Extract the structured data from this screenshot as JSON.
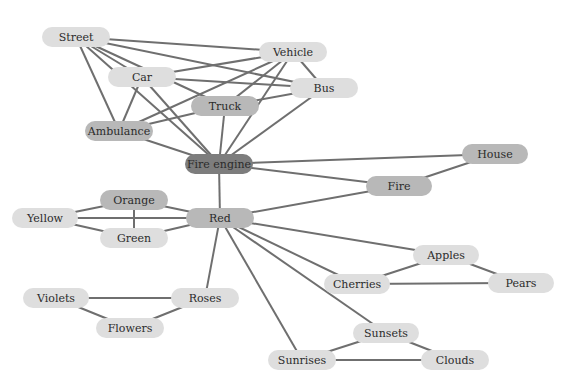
{
  "diagram": {
    "type": "concept-network",
    "colors": {
      "edge": "#6f6f6f",
      "light": "#dedede",
      "medium": "#b8b8b8",
      "dark": "#7d7d7d"
    },
    "nodes": [
      {
        "id": "street",
        "label": "Street",
        "x": 76,
        "y": 37,
        "w": 68,
        "shade": "light"
      },
      {
        "id": "vehicle",
        "label": "Vehicle",
        "x": 293,
        "y": 52,
        "w": 68,
        "shade": "light"
      },
      {
        "id": "car",
        "label": "Car",
        "x": 142,
        "y": 77,
        "w": 68,
        "shade": "light"
      },
      {
        "id": "bus",
        "label": "Bus",
        "x": 324,
        "y": 88,
        "w": 68,
        "shade": "light"
      },
      {
        "id": "truck",
        "label": "Truck",
        "x": 225,
        "y": 106,
        "w": 68,
        "shade": "medium"
      },
      {
        "id": "ambulance",
        "label": "Ambulance",
        "x": 119,
        "y": 131,
        "w": 68,
        "shade": "medium"
      },
      {
        "id": "fire_engine",
        "label": "Fire engine",
        "x": 219,
        "y": 164,
        "w": 68,
        "shade": "dark"
      },
      {
        "id": "house",
        "label": "House",
        "x": 495,
        "y": 154,
        "w": 66,
        "shade": "medium"
      },
      {
        "id": "fire",
        "label": "Fire",
        "x": 399,
        "y": 186,
        "w": 66,
        "shade": "medium"
      },
      {
        "id": "orange",
        "label": "Orange",
        "x": 134,
        "y": 200,
        "w": 68,
        "shade": "medium"
      },
      {
        "id": "yellow",
        "label": "Yellow",
        "x": 45,
        "y": 218,
        "w": 66,
        "shade": "light"
      },
      {
        "id": "red",
        "label": "Red",
        "x": 220,
        "y": 218,
        "w": 68,
        "shade": "medium"
      },
      {
        "id": "green",
        "label": "Green",
        "x": 134,
        "y": 238,
        "w": 68,
        "shade": "light"
      },
      {
        "id": "apples",
        "label": "Apples",
        "x": 446,
        "y": 255,
        "w": 66,
        "shade": "light"
      },
      {
        "id": "cherries",
        "label": "Cherries",
        "x": 357,
        "y": 284,
        "w": 66,
        "shade": "light"
      },
      {
        "id": "pears",
        "label": "Pears",
        "x": 521,
        "y": 283,
        "w": 66,
        "shade": "light"
      },
      {
        "id": "violets",
        "label": "Violets",
        "x": 56,
        "y": 298,
        "w": 66,
        "shade": "light"
      },
      {
        "id": "roses",
        "label": "Roses",
        "x": 205,
        "y": 298,
        "w": 68,
        "shade": "light"
      },
      {
        "id": "flowers",
        "label": "Flowers",
        "x": 130,
        "y": 328,
        "w": 68,
        "shade": "light"
      },
      {
        "id": "sunsets",
        "label": "Sunsets",
        "x": 386,
        "y": 333,
        "w": 66,
        "shade": "light"
      },
      {
        "id": "sunrises",
        "label": "Sunrises",
        "x": 302,
        "y": 360,
        "w": 68,
        "shade": "light"
      },
      {
        "id": "clouds",
        "label": "Clouds",
        "x": 455,
        "y": 360,
        "w": 68,
        "shade": "light"
      }
    ],
    "edges": [
      [
        "street",
        "vehicle"
      ],
      [
        "street",
        "bus"
      ],
      [
        "street",
        "truck"
      ],
      [
        "street",
        "car"
      ],
      [
        "street",
        "ambulance"
      ],
      [
        "street",
        "fire_engine"
      ],
      [
        "car",
        "vehicle"
      ],
      [
        "car",
        "bus"
      ],
      [
        "car",
        "ambulance"
      ],
      [
        "car",
        "fire_engine"
      ],
      [
        "vehicle",
        "ambulance"
      ],
      [
        "vehicle",
        "truck"
      ],
      [
        "vehicle",
        "bus"
      ],
      [
        "vehicle",
        "fire_engine"
      ],
      [
        "bus",
        "truck"
      ],
      [
        "bus",
        "fire_engine"
      ],
      [
        "truck",
        "ambulance"
      ],
      [
        "truck",
        "fire_engine"
      ],
      [
        "ambulance",
        "fire_engine"
      ],
      [
        "fire_engine",
        "house"
      ],
      [
        "fire_engine",
        "fire"
      ],
      [
        "fire_engine",
        "red"
      ],
      [
        "house",
        "fire"
      ],
      [
        "fire",
        "red"
      ],
      [
        "red",
        "orange"
      ],
      [
        "red",
        "yellow"
      ],
      [
        "red",
        "green"
      ],
      [
        "orange",
        "yellow"
      ],
      [
        "orange",
        "green"
      ],
      [
        "yellow",
        "green"
      ],
      [
        "red",
        "roses"
      ],
      [
        "red",
        "sunrises"
      ],
      [
        "red",
        "sunsets"
      ],
      [
        "red",
        "cherries"
      ],
      [
        "red",
        "apples"
      ],
      [
        "apples",
        "cherries"
      ],
      [
        "apples",
        "pears"
      ],
      [
        "cherries",
        "pears"
      ],
      [
        "violets",
        "roses"
      ],
      [
        "violets",
        "flowers"
      ],
      [
        "roses",
        "flowers"
      ],
      [
        "sunsets",
        "sunrises"
      ],
      [
        "sunsets",
        "clouds"
      ],
      [
        "sunrises",
        "clouds"
      ]
    ]
  }
}
